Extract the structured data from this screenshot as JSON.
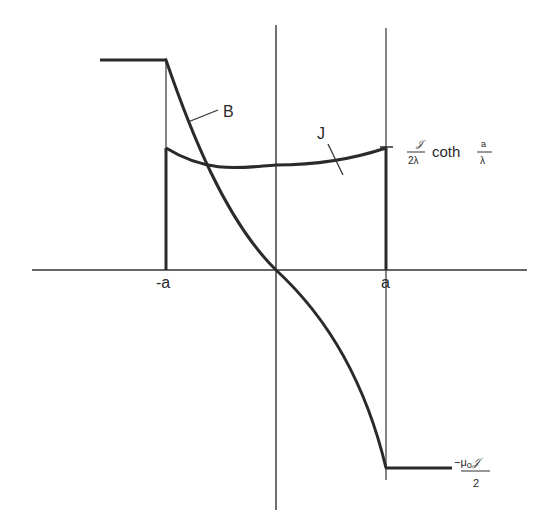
{
  "diagram": {
    "type": "physics-profile",
    "curves": [
      {
        "name": "B",
        "label": "B",
        "shape": "flat at top left of -a, decreasing through origin, flat at bottom right of a"
      },
      {
        "name": "J",
        "label": "J",
        "shape": "cosh-like, minimum at center, maximum at ±a"
      }
    ],
    "x_ticks": [
      {
        "label": "-a",
        "position": "left boundary"
      },
      {
        "label": "a",
        "position": "right boundary"
      }
    ],
    "annotations": {
      "j_max": {
        "numerator": "𝒥",
        "denominator": "2λ",
        "function": "coth",
        "arg_numerator": "a",
        "arg_denominator": "λ"
      },
      "b_min": {
        "numerator": "−μ₀𝒥",
        "denominator": "2"
      }
    }
  },
  "labels": {
    "B": "B",
    "J": "J",
    "neg_a": "-a",
    "pos_a": "a",
    "jmax_num": "𝒥",
    "jmax_den": "2λ",
    "coth": "coth",
    "arg_num": "a",
    "arg_den": "λ",
    "bmin_num": "−μ",
    "bmin_sub": "o",
    "bmin_sym": "𝒥",
    "bmin_den": "2"
  },
  "colors": {
    "ink": "#2a2a2a",
    "background": "#ffffff"
  }
}
